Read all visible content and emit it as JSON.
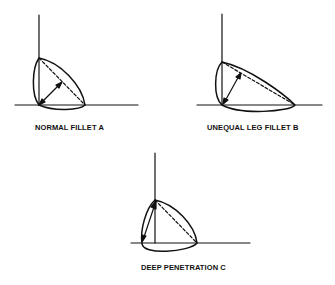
{
  "diagram": {
    "type": "weld fillet cross-sections",
    "figures": [
      {
        "id": "A",
        "label": "NORMAL FILLET A"
      },
      {
        "id": "B",
        "label": "UNEQUAL LEG FILLET B"
      },
      {
        "id": "C",
        "label": "DEEP PENETRATION C"
      }
    ],
    "colors": {
      "line": "#111111",
      "background": "#ffffff"
    }
  }
}
